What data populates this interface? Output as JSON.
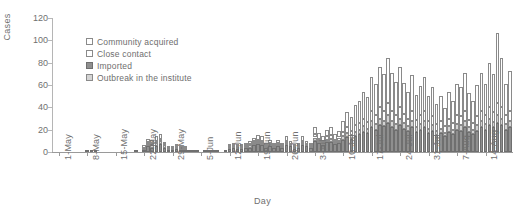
{
  "chart_data": {
    "type": "bar",
    "stacked": true,
    "title": "",
    "xlabel": "Day",
    "ylabel": "Cases",
    "ylim": [
      0,
      120
    ],
    "yticks": [
      0,
      20,
      40,
      60,
      80,
      100,
      120
    ],
    "grid": false,
    "legend_position": "top-left",
    "legend": [
      "Community acquired",
      "Close contact",
      "Imported",
      "Outbreak in the institute"
    ],
    "colors": {
      "community_acquired": "#ffffff",
      "close_contact": "#ffffff",
      "imported": "#8f8f8f",
      "outbreak_in_the_institute": "#d4d4d4",
      "axis": "#9a9a9a",
      "text": "#6e6e6e"
    },
    "xtick_labels": [
      "1-May",
      "8-May",
      "15-May",
      "22-May",
      "29-May",
      "5-Jun",
      "12-Jun",
      "19-Jun",
      "26-Jun",
      "3-Jul",
      "10-Jul",
      "17-Jul",
      "24-Jul",
      "31-Jul",
      "7-Aug",
      "14-Aug"
    ],
    "xtick_indices": [
      0,
      7,
      14,
      21,
      28,
      35,
      42,
      49,
      56,
      63,
      70,
      77,
      84,
      91,
      98,
      105
    ],
    "categories": [
      "1-May",
      "2-May",
      "3-May",
      "4-May",
      "5-May",
      "6-May",
      "7-May",
      "8-May",
      "9-May",
      "10-May",
      "11-May",
      "12-May",
      "13-May",
      "14-May",
      "15-May",
      "16-May",
      "17-May",
      "18-May",
      "19-May",
      "20-May",
      "21-May",
      "22-May",
      "23-May",
      "24-May",
      "25-May",
      "26-May",
      "27-May",
      "28-May",
      "29-May",
      "30-May",
      "31-May",
      "1-Jun",
      "2-Jun",
      "3-Jun",
      "4-Jun",
      "5-Jun",
      "6-Jun",
      "7-Jun",
      "8-Jun",
      "9-Jun",
      "10-Jun",
      "11-Jun",
      "12-Jun",
      "13-Jun",
      "14-Jun",
      "15-Jun",
      "16-Jun",
      "17-Jun",
      "18-Jun",
      "19-Jun",
      "20-Jun",
      "21-Jun",
      "22-Jun",
      "23-Jun",
      "24-Jun",
      "25-Jun",
      "26-Jun",
      "27-Jun",
      "28-Jun",
      "29-Jun",
      "30-Jun",
      "1-Jul",
      "2-Jul",
      "3-Jul",
      "4-Jul",
      "5-Jul",
      "6-Jul",
      "7-Jul",
      "8-Jul",
      "9-Jul",
      "10-Jul",
      "11-Jul",
      "12-Jul",
      "13-Jul",
      "14-Jul",
      "15-Jul",
      "16-Jul",
      "17-Jul",
      "18-Jul",
      "19-Jul",
      "20-Jul",
      "21-Jul",
      "22-Jul",
      "23-Jul",
      "24-Jul",
      "25-Jul",
      "26-Jul",
      "27-Jul",
      "28-Jul",
      "29-Jul",
      "30-Jul",
      "31-Jul",
      "1-Aug",
      "2-Aug",
      "3-Aug",
      "4-Aug",
      "5-Aug",
      "6-Aug",
      "7-Aug",
      "8-Aug",
      "9-Aug",
      "10-Aug",
      "11-Aug",
      "12-Aug",
      "13-Aug",
      "14-Aug",
      "15-Aug",
      "16-Aug",
      "17-Aug",
      "18-Aug",
      "19-Aug",
      "20-Aug"
    ],
    "series": [
      {
        "name": "Imported",
        "values": [
          0,
          0,
          0,
          0,
          0,
          0,
          0,
          1,
          1,
          1,
          0,
          0,
          0,
          0,
          0,
          0,
          0,
          0,
          0,
          1,
          0,
          2,
          5,
          4,
          5,
          7,
          4,
          2,
          2,
          3,
          2,
          2,
          1,
          1,
          1,
          0,
          1,
          1,
          1,
          1,
          0,
          1,
          3,
          4,
          3,
          3,
          4,
          4,
          6,
          7,
          6,
          4,
          5,
          4,
          5,
          4,
          6,
          5,
          3,
          4,
          6,
          5,
          4,
          10,
          8,
          6,
          9,
          9,
          7,
          8,
          11,
          13,
          12,
          14,
          16,
          18,
          17,
          22,
          20,
          24,
          23,
          26,
          22,
          20,
          24,
          21,
          19,
          22,
          18,
          20,
          22,
          17,
          19,
          15,
          17,
          14,
          18,
          16,
          20,
          19,
          22,
          18,
          16,
          19,
          22,
          20,
          24,
          22,
          26,
          24,
          20,
          22
        ]
      },
      {
        "name": "Outbreak in the institute",
        "values": [
          0,
          0,
          0,
          0,
          0,
          0,
          0,
          0,
          0,
          0,
          0,
          0,
          0,
          0,
          0,
          0,
          0,
          0,
          0,
          0,
          0,
          1,
          2,
          2,
          3,
          3,
          2,
          1,
          1,
          1,
          1,
          1,
          0,
          0,
          0,
          0,
          0,
          0,
          0,
          0,
          0,
          0,
          1,
          1,
          1,
          1,
          1,
          2,
          2,
          2,
          2,
          1,
          2,
          1,
          2,
          1,
          2,
          1,
          1,
          1,
          2,
          1,
          1,
          3,
          2,
          2,
          2,
          3,
          2,
          2,
          3,
          4,
          3,
          4,
          4,
          5,
          4,
          6,
          5,
          6,
          5,
          7,
          6,
          5,
          6,
          5,
          4,
          6,
          4,
          5,
          6,
          4,
          5,
          4,
          4,
          3,
          5,
          4,
          5,
          5,
          6,
          4,
          4,
          5,
          6,
          5,
          6,
          5,
          7,
          6,
          5,
          6
        ]
      },
      {
        "name": "Close contact",
        "values": [
          0,
          0,
          0,
          0,
          0,
          0,
          0,
          0,
          0,
          0,
          0,
          0,
          0,
          0,
          0,
          0,
          0,
          0,
          0,
          0,
          0,
          1,
          2,
          2,
          2,
          2,
          1,
          1,
          1,
          1,
          1,
          1,
          0,
          0,
          0,
          0,
          0,
          0,
          0,
          0,
          0,
          0,
          1,
          1,
          1,
          1,
          1,
          1,
          2,
          2,
          2,
          1,
          1,
          1,
          1,
          1,
          2,
          1,
          1,
          1,
          2,
          1,
          1,
          3,
          2,
          2,
          3,
          3,
          2,
          3,
          4,
          5,
          4,
          6,
          6,
          7,
          6,
          9,
          8,
          10,
          9,
          11,
          9,
          8,
          10,
          8,
          7,
          9,
          7,
          8,
          9,
          7,
          8,
          6,
          7,
          6,
          7,
          6,
          8,
          8,
          9,
          7,
          6,
          8,
          9,
          8,
          10,
          9,
          11,
          10,
          8,
          9
        ]
      },
      {
        "name": "Community acquired",
        "values": [
          0,
          0,
          0,
          0,
          0,
          0,
          0,
          0,
          0,
          0,
          0,
          0,
          0,
          0,
          0,
          0,
          0,
          0,
          0,
          0,
          0,
          2,
          3,
          3,
          4,
          4,
          2,
          1,
          1,
          2,
          1,
          1,
          0,
          0,
          0,
          0,
          0,
          0,
          0,
          0,
          0,
          0,
          2,
          2,
          2,
          2,
          2,
          3,
          3,
          4,
          4,
          2,
          3,
          2,
          3,
          2,
          4,
          3,
          2,
          2,
          4,
          3,
          2,
          6,
          5,
          4,
          6,
          7,
          5,
          6,
          10,
          14,
          12,
          18,
          20,
          24,
          22,
          30,
          28,
          36,
          33,
          40,
          34,
          30,
          36,
          28,
          24,
          32,
          22,
          26,
          30,
          22,
          26,
          18,
          22,
          16,
          24,
          20,
          28,
          26,
          34,
          24,
          20,
          28,
          34,
          28,
          40,
          34,
          63,
          44,
          28,
          36
        ]
      }
    ]
  }
}
